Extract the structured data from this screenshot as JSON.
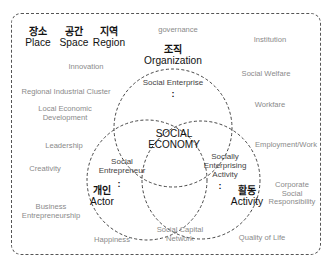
{
  "diagram": {
    "dimensions": {
      "place": {
        "ko": "장소",
        "en": "Place"
      },
      "space": {
        "ko": "공간",
        "en": "Space"
      },
      "region": {
        "ko": "지역",
        "en": "Region"
      }
    },
    "circles": {
      "organization": {
        "ko": "조직",
        "en": "Organization",
        "inner": "Social Enterprise",
        "colon": ":"
      },
      "actor": {
        "ko": "개인",
        "en": "Actor",
        "inner_line1": "Social",
        "inner_line2": "Entrepreneur",
        "colon": ":"
      },
      "activity": {
        "ko": "활동",
        "en": "Activity",
        "inner_line1": "Socially",
        "inner_line2": "Enterprising",
        "inner_line3": "Activity",
        "colon": ":"
      }
    },
    "center": {
      "line1": "SOCIAL",
      "line2": "ECONOMY"
    },
    "keywords": {
      "governance": "governance",
      "institution": "Institution",
      "innovation": "Innovation",
      "social_welfare": "Social Welfare",
      "regional_cluster": "Regional Industrial Cluster",
      "local_econ_1": "Local Economic",
      "local_econ_2": "Development",
      "workfare": "Workfare",
      "leadership": "Leadership",
      "employment": "Employment/Work",
      "creativity": "Creativity",
      "csr_1": "Corporate",
      "csr_2": "Social",
      "csr_3": "Responsibility",
      "business_1": "Business",
      "business_2": "Entrepreneurship",
      "happiness": "Happiness",
      "social_capital_1": "Social Capital",
      "social_capital_2": "Network",
      "quality_of_life": "Quality of Life"
    }
  }
}
